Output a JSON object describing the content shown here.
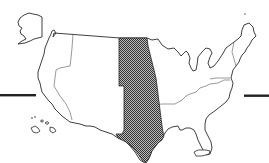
{
  "map": {
    "title": "United States map with highlighted central region",
    "highlighted_region": "Central plains states (North Dakota, South Dakota, Nebraska, Kansas, Oklahoma, Texas)",
    "colors": {
      "background": "#ffffff",
      "outline": "#2a2a2a",
      "highlight_fill_dark": "#3a3a3a",
      "highlight_fill_light": "#bdbdbd",
      "bars": "#222222"
    },
    "insets": [
      "Alaska",
      "Hawaii"
    ],
    "decorations": [
      "left-horizontal-bar",
      "right-horizontal-bar"
    ]
  }
}
